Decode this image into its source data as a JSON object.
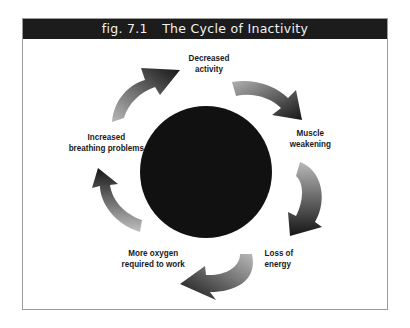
{
  "figure": {
    "number": "fig. 7.1",
    "title": "The Cycle of Inactivity"
  },
  "diagram": {
    "type": "cycle",
    "center_shape": "black-circle",
    "steps": [
      {
        "line1": "Decreased",
        "line2": "activity"
      },
      {
        "line1": "Muscle",
        "line2": "weakening"
      },
      {
        "line1": "Loss of",
        "line2": "energy"
      },
      {
        "line1": "More oxygen",
        "line2": "required to work"
      },
      {
        "line1": "Increased",
        "line2": "breathing problems"
      }
    ],
    "arrow_direction": "clockwise",
    "colors": {
      "title_bar": "#1c1c1c",
      "circle": "#111111",
      "arrow_dark": "#1a1a1a",
      "arrow_light": "#b0b0b0"
    }
  }
}
